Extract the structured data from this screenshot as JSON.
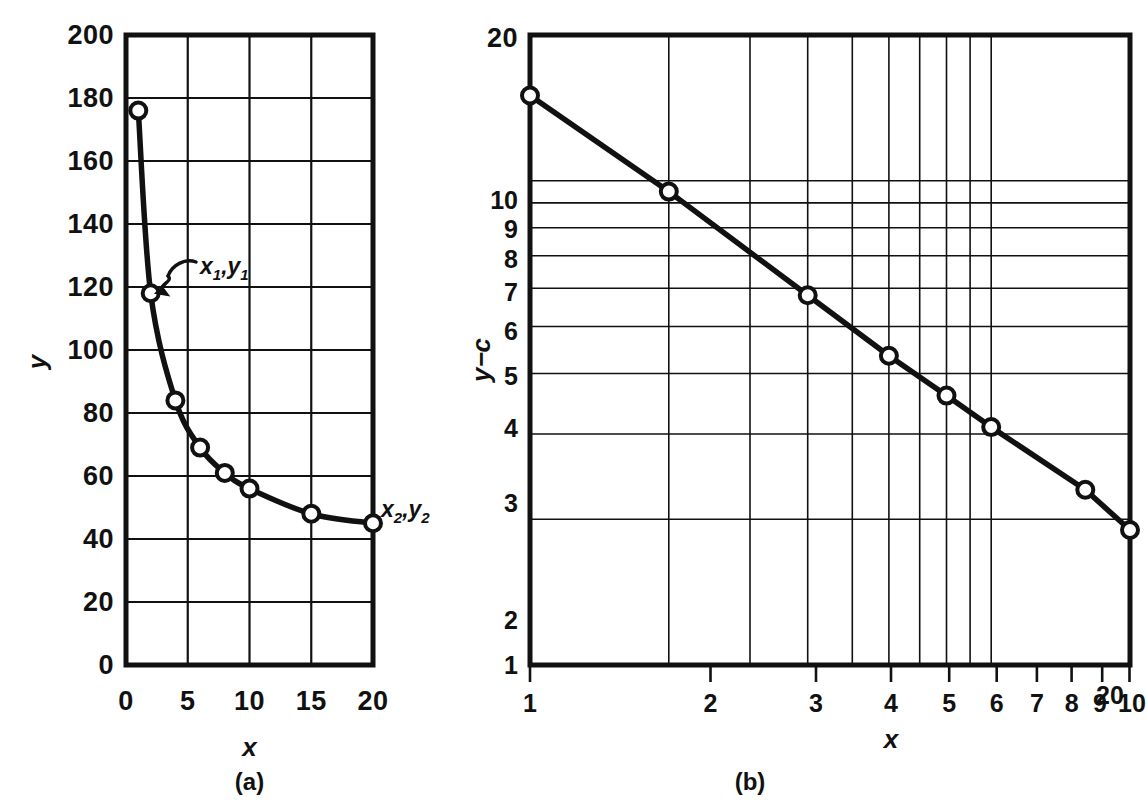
{
  "figure": {
    "panels": [
      {
        "caption": "(a)",
        "xlabel": "x",
        "ylabel": "y"
      },
      {
        "caption": "(b)",
        "xlabel": "x",
        "ylabel": "y−c"
      }
    ],
    "annotations": [
      {
        "id": "p1",
        "base": "x",
        "sub1": "1",
        "mid": ",",
        "base2": "y",
        "sub2": "1",
        "text": "x₁,y₁"
      },
      {
        "id": "p2",
        "base": "x",
        "sub1": "2",
        "mid": ",",
        "base2": "y",
        "sub2": "2",
        "text": "x₂,y₂"
      }
    ]
  },
  "chart_data": [
    {
      "type": "line",
      "panel": "(a)",
      "title": "",
      "xlabel": "x",
      "ylabel": "y",
      "xscale": "linear",
      "yscale": "linear",
      "xlim": [
        0,
        20
      ],
      "ylim": [
        0,
        200
      ],
      "grid": true,
      "legend": "none",
      "xticks": [
        0,
        5,
        10,
        15,
        20
      ],
      "xticklabels": [
        "0",
        "5",
        "10",
        "15",
        "20"
      ],
      "yticks": [
        0,
        20,
        40,
        60,
        80,
        100,
        120,
        140,
        160,
        180,
        200
      ],
      "yticklabels": [
        "0",
        "20",
        "40",
        "60",
        "80",
        "100",
        "120",
        "140",
        "160",
        "180",
        "200"
      ],
      "x": [
        1,
        2,
        4,
        6,
        8,
        10,
        15,
        20
      ],
      "values": [
        176,
        118,
        84,
        69,
        61,
        56,
        48,
        45
      ],
      "markers": "open-circle",
      "annotations": [
        {
          "text": "x₁,y₁",
          "point": [
            2,
            118
          ],
          "arrow": true
        },
        {
          "text": "x₂,y₂",
          "point": [
            20,
            45
          ],
          "arrow": false
        }
      ]
    },
    {
      "type": "line",
      "panel": "(b)",
      "title": "",
      "xlabel": "x",
      "ylabel": "y−c",
      "xscale": "log",
      "yscale": "log",
      "xlim": [
        1,
        20
      ],
      "ylim": [
        1,
        20
      ],
      "grid": true,
      "legend": "none",
      "xticks": [
        1,
        2,
        3,
        4,
        5,
        6,
        7,
        8,
        9,
        10,
        20
      ],
      "xticklabels": [
        "1",
        "2",
        "3",
        "4",
        "5",
        "6",
        "7",
        "8",
        "9",
        "10",
        "20"
      ],
      "yticks": [
        1,
        2,
        3,
        4,
        5,
        6,
        7,
        8,
        9,
        10,
        20
      ],
      "yticklabels": [
        "1",
        "2",
        "3",
        "4",
        "5",
        "6",
        "7",
        "8",
        "9",
        "10",
        "20"
      ],
      "x": [
        1,
        2,
        4,
        6,
        8,
        10,
        16,
        20
      ],
      "values": [
        15,
        9.5,
        5.8,
        4.35,
        3.6,
        3.1,
        2.3,
        1.9
      ],
      "markers": "open-circle"
    }
  ]
}
